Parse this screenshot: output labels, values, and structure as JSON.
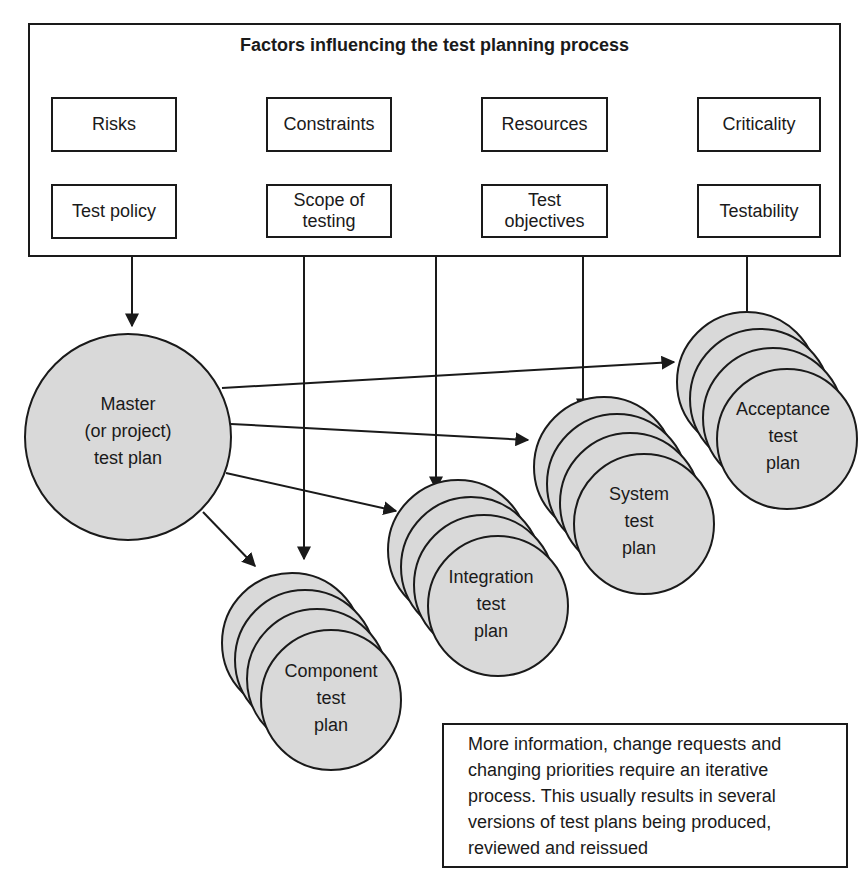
{
  "diagram": {
    "title": "Factors influencing the test planning process",
    "factors": [
      {
        "label": "Risks"
      },
      {
        "label": "Constraints"
      },
      {
        "label": "Resources"
      },
      {
        "label": "Criticality"
      },
      {
        "label": "Test policy"
      },
      {
        "label": "Scope of testing"
      },
      {
        "label": "Test objectives"
      },
      {
        "label": "Testability"
      }
    ],
    "master_plan": {
      "line1": "Master",
      "line2": "(or project)",
      "line3": "test plan"
    },
    "plans": [
      {
        "line1": "Component",
        "line2": "test",
        "line3": "plan"
      },
      {
        "line1": "Integration",
        "line2": "test",
        "line3": "plan"
      },
      {
        "line1": "System",
        "line2": "test",
        "line3": "plan"
      },
      {
        "line1": "Acceptance",
        "line2": "test",
        "line3": "plan"
      }
    ],
    "note": "More information, change requests and changing priorities require an iterative process. This usually results in several versions of test plans being produced, reviewed and reissued",
    "colors": {
      "circle_fill": "#d9d9d9",
      "stroke": "#1a1a1a",
      "background": "#ffffff"
    }
  }
}
